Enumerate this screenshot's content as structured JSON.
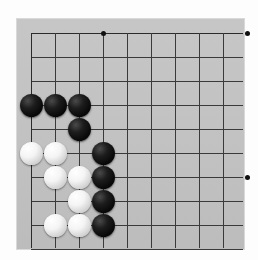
{
  "board": {
    "title": "Go board position",
    "background_color": "#c3c3c3",
    "line_color": "#3a3a3a",
    "page_background": "#ffffff",
    "columns": 10,
    "rows": 10,
    "cell_size": 24,
    "origin_x": 31,
    "origin_y": 33,
    "cropped_edges": [
      "bottom",
      "right"
    ],
    "star_points": [
      {
        "col": 3,
        "row": 0,
        "label": "star-point-top-left"
      },
      {
        "col": 9,
        "row": 0,
        "label": "star-point-top-right"
      },
      {
        "col": 9,
        "row": 6,
        "label": "star-point-right-side"
      }
    ],
    "stones": [
      {
        "col": 0,
        "row": 3,
        "color": "black"
      },
      {
        "col": 1,
        "row": 3,
        "color": "black"
      },
      {
        "col": 2,
        "row": 3,
        "color": "black"
      },
      {
        "col": 2,
        "row": 4,
        "color": "black"
      },
      {
        "col": 3,
        "row": 5,
        "color": "black"
      },
      {
        "col": 3,
        "row": 6,
        "color": "black"
      },
      {
        "col": 3,
        "row": 7,
        "color": "black"
      },
      {
        "col": 3,
        "row": 8,
        "color": "black"
      },
      {
        "col": 0,
        "row": 5,
        "color": "white"
      },
      {
        "col": 1,
        "row": 5,
        "color": "white"
      },
      {
        "col": 1,
        "row": 6,
        "color": "white"
      },
      {
        "col": 2,
        "row": 6,
        "color": "white"
      },
      {
        "col": 2,
        "row": 7,
        "color": "white"
      },
      {
        "col": 1,
        "row": 8,
        "color": "white"
      },
      {
        "col": 2,
        "row": 8,
        "color": "white"
      }
    ],
    "stone_diameter": 23,
    "black_count": 8,
    "white_count": 7
  }
}
